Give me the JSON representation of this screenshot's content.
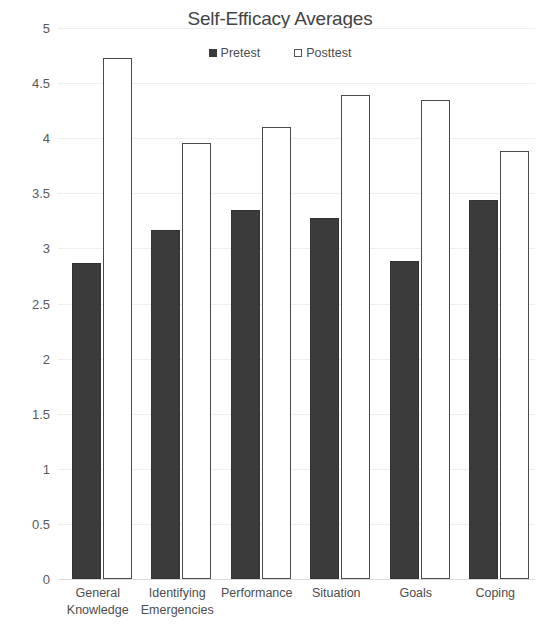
{
  "chart_data": {
    "type": "bar",
    "title": "Self-Efficacy Averages",
    "xlabel": "",
    "ylabel": "",
    "ylim": [
      0,
      5
    ],
    "ytick_labels": [
      "5",
      "4.5",
      "4",
      "3.5",
      "3",
      "2.5",
      "2",
      "1.5",
      "1",
      "0.5",
      "0"
    ],
    "ytick_values": [
      5,
      4.5,
      4,
      3.5,
      3,
      2.5,
      2,
      1.5,
      1,
      0.5,
      0
    ],
    "grid": true,
    "legend_position": "top-center",
    "categories": [
      "General\nKnowledge",
      "Identifying\nEmergencies",
      "Performance",
      "Situation",
      "Goals",
      "Coping"
    ],
    "series": [
      {
        "name": "Pretest",
        "color": "#3b3b3b",
        "values": [
          2.87,
          3.17,
          3.35,
          3.28,
          2.89,
          3.44
        ]
      },
      {
        "name": "Posttest",
        "color": "#ffffff",
        "values": [
          4.73,
          3.96,
          4.1,
          4.39,
          4.35,
          3.88
        ]
      }
    ]
  },
  "legend": {
    "entries": [
      {
        "label": "Pretest",
        "marker": "filled-square-icon"
      },
      {
        "label": "Posttest",
        "marker": "hollow-square-icon"
      }
    ]
  }
}
